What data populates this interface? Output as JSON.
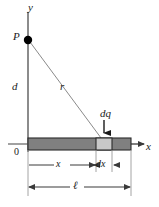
{
  "figure": {
    "background_color": "#ffffff",
    "line_color": "#3a3a3a",
    "text_color": "#1a1a1a",
    "rod_fill_color": "#808080",
    "element_fill_color": "#c8c8c8",
    "point_color": "#000000",
    "labels": {
      "y_axis": "y",
      "point_p": "P",
      "distance_d": "d",
      "distance_r": "r",
      "charge_element": "dq",
      "origin": "0",
      "x_axis": "x",
      "x_dimension": "x",
      "dx_dimension": "dx",
      "length_ell": "ℓ"
    },
    "geometry": {
      "origin_px": [
        28,
        143
      ],
      "point_p_px": [
        28,
        40
      ],
      "y_axis_top_px": [
        28,
        10
      ],
      "rod_left_px": 28,
      "rod_right_px": 131,
      "rod_top_px": 138,
      "rod_bottom_px": 150,
      "element_left_px": 96,
      "element_right_px": 112,
      "x_axis_arrow_tip_px": [
        145,
        144
      ],
      "dq_arrow_tip_px": [
        104,
        136
      ],
      "x_dim_line_y_px": 165,
      "ell_dim_line_y_px": 187
    }
  }
}
